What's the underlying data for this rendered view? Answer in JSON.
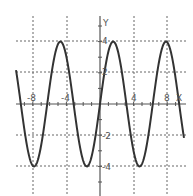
{
  "chart_data": {
    "type": "line",
    "title": "",
    "xlabel": "X",
    "ylabel": "Y",
    "function": "y = 4 sin(x)",
    "xlim": [
      -10,
      10
    ],
    "ylim": [
      -4.3,
      4.3
    ],
    "grid": true,
    "x_ticks": [
      -8,
      -4,
      4,
      8
    ],
    "x_tick_labels": [
      "-8",
      "-4",
      "4",
      "8"
    ],
    "y_ticks": [
      4,
      2,
      -2,
      -4
    ],
    "y_tick_labels": [
      "4",
      "2",
      "-2",
      "-4"
    ],
    "series": [
      {
        "name": "y = 4 sin x",
        "x": [
          -10,
          -7.85,
          -4.71,
          -1.57,
          0,
          1.57,
          4.71,
          7.85,
          10
        ],
        "values": [
          2.18,
          -4,
          4,
          -4,
          0,
          4,
          -4,
          4,
          -2.18
        ]
      }
    ],
    "colors": {
      "curve": "#333333",
      "axis": "#555555",
      "grid": "#666666"
    }
  }
}
